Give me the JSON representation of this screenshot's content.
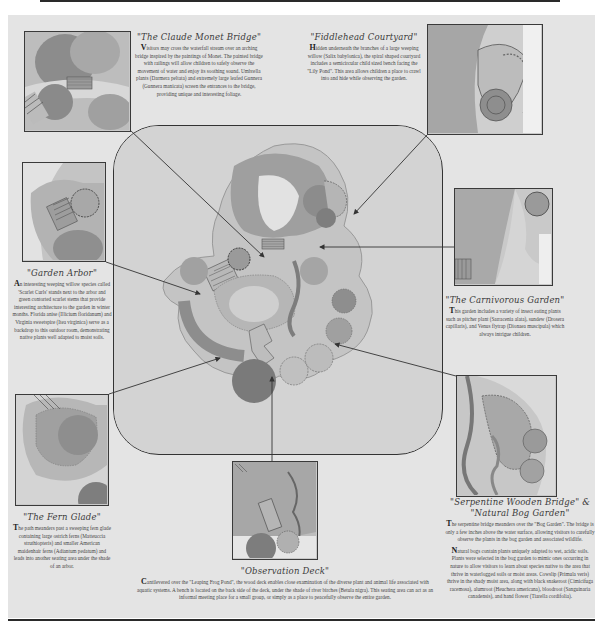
{
  "page": {
    "background": "#ffffff",
    "panel_color": "#e4e4e4",
    "rule_color": "#2a2a2a"
  },
  "map": {
    "label": "Garden master plan",
    "arrows_to": [
      "The Claude Monet Bridge",
      "Fiddlehead Courtyard",
      "Garden Arbor",
      "The Carnivorous Garden",
      "The Fern Glade",
      "Serpentine Wooden Bridge & Natural Bog Garden",
      "Observation Deck"
    ]
  },
  "sections": {
    "monet": {
      "title": "\"The Claude Monet Bridge\"",
      "dropcap": "V",
      "body": "isitors may cross the waterfall stream over an arching bridge inspired by the paintings of Monet. The painted bridge with railings will allow children to safely observe the movement of water and enjoy its soothing sound. Umbrella plants (Darmera peltata) and extremely large leafed Gunnera (Gunnera manicata) screen the entrances to the bridge, providing unique and interesting foliage."
    },
    "fiddlehead": {
      "title": "\"Fiddlehead Courtyard\"",
      "dropcap": "H",
      "body": "idden underneath the branches of a large weeping willow (Salix babylonica), the spiral shaped courtyard includes a semicircular child sized bench facing the \"Lily Pond\". This area allows children a place to crawl into and hide while observing the garden."
    },
    "arbor": {
      "title": "\"Garden Arbor\"",
      "dropcap": "A",
      "body": "n interesting weeping willow species called 'Scarlet Curls' stands next to the arbor and green contorted scarlet stems that provide interesting architecture to the garden in winter months. Florida anise (Illicium floridanum) and Virginia sweetspire (Itea virginica) serve as a backdrop to this outdoor room, demonstrating native plants well adapted to moist soils."
    },
    "carnivorous": {
      "title": "\"The Carnivorous Garden\"",
      "dropcap": "T",
      "body": "his garden includes a variety of insect eating plants such as pitcher plant (Sarracenia alata), sundew (Drosera capillaris), and Venus flytrap (Dionaea muscipula) which always intrigue children."
    },
    "fern": {
      "title": "\"The Fern Glade\"",
      "dropcap": "T",
      "body": "he path meanders past a sweeping fern glade containing large ostrich ferns (Matteuccia struthiopteris) and smaller American maidenhair ferns (Adiantum pedatum) and leads into another seating area under the shade of an arbor."
    },
    "observation": {
      "title": "\"Observation Deck\"",
      "dropcap": "C",
      "body": "antilevered over the \"Leaping Frog Pond\", the wood deck enables close examination of the diverse plant and animal life associated with aquatic systems. A bench is located on the back side of the deck, under the shade of river birches (Betula nigra). This seating area can act as an informal meeting place for a small group, or simply as a place to peacefully observe the entire garden."
    },
    "serpentine": {
      "title_line1": "\"Serpentine Wooden Bridge\" &",
      "title_line2": "\"Natural Bog Garden\"",
      "dropcap1": "T",
      "body1": "he serpentine bridge meanders over the \"Bog Garden\". The bridge is only a few inches above the water surface, allowing visitors to carefully observe the plants in the bog garden and associated wildlife.",
      "dropcap2": "N",
      "body2": "atural bogs contain plants uniquely adapted to wet, acidic soils. Plants were selected in the bog garden to mimic ones occurring in nature to allow visitors to learn about species native to the area that thrive in waterlogged soils or moist areas. Cowslip (Primula veris) thrive in the shady moist area, along with black snakeroot (Cimicifuga racemosa), alumroot (Heuchera americana), bloodroot (Sanguinaria canadensis), and hand flower (Tiarella cordifolia)."
    }
  }
}
